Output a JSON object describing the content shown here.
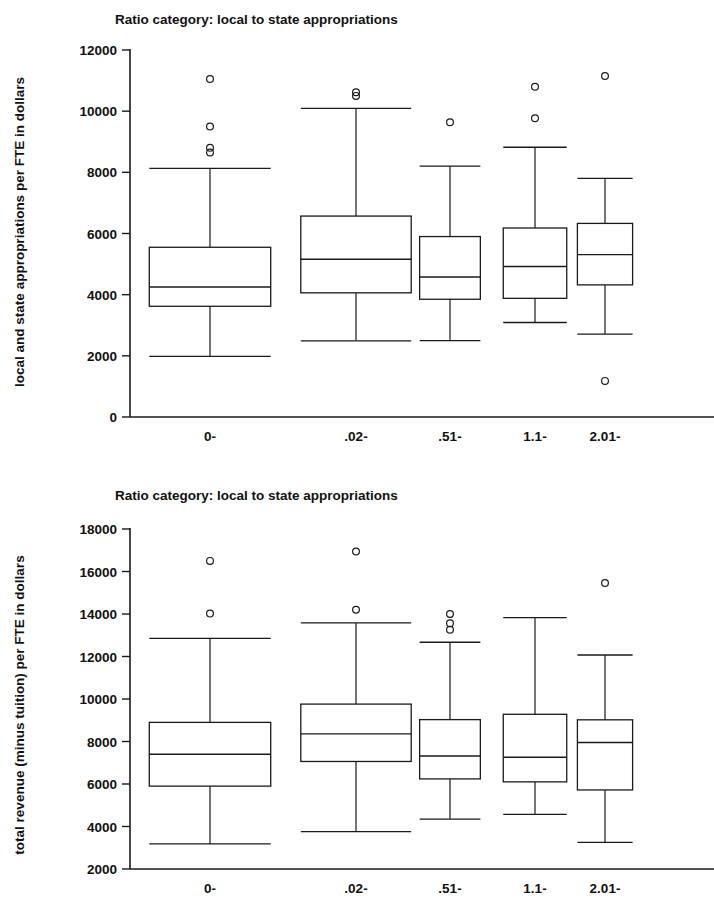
{
  "figure": {
    "background_color": "#ffffff",
    "ink_color": "#1a1a1a"
  },
  "chart_data": [
    {
      "id": "top",
      "type": "box",
      "title": "Ratio category: local to state appropriations",
      "xlabel": "",
      "ylabel": "local and state appropriations per FTE in dollars",
      "ylim": [
        0,
        12000
      ],
      "ytick_step": 2000,
      "ytick_labels": [
        "0",
        "2000",
        "4000",
        "6000",
        "8000",
        "10000",
        "12000"
      ],
      "grid": false,
      "legend": "none",
      "categories": [
        "0-",
        ".02-",
        ".51-",
        "1.1-",
        "2.01-"
      ],
      "boxes": [
        {
          "category": "0-",
          "whisker_low": 1980,
          "q1": 3620,
          "median": 4250,
          "q3": 5550,
          "whisker_high": 8130,
          "outliers": [
            11050,
            9500,
            8800,
            8650
          ],
          "width_frac": 0.88
        },
        {
          "category": ".02-",
          "whisker_low": 2490,
          "q1": 4060,
          "median": 5160,
          "q3": 6570,
          "whisker_high": 10090,
          "outliers": [
            10620,
            10500
          ],
          "width_frac": 0.8
        },
        {
          "category": ".51-",
          "whisker_low": 2500,
          "q1": 3850,
          "median": 4580,
          "q3": 5900,
          "whisker_high": 8200,
          "outliers": [
            9640
          ],
          "width_frac": 0.44
        },
        {
          "category": "1.1-",
          "whisker_low": 3090,
          "q1": 3880,
          "median": 4920,
          "q3": 6180,
          "whisker_high": 8820,
          "outliers": [
            10800,
            9770
          ],
          "width_frac": 0.46
        },
        {
          "category": "2.01-",
          "whisker_low": 2710,
          "q1": 4320,
          "median": 5310,
          "q3": 6330,
          "whisker_high": 7800,
          "outliers": [
            11150,
            1180
          ],
          "width_frac": 0.4
        }
      ]
    },
    {
      "id": "bottom",
      "type": "box",
      "title": "Ratio category: local to state appropriations",
      "xlabel": "",
      "ylabel": "total revenue (minus tuition) per FTE in dollars",
      "ylim": [
        2000,
        18000
      ],
      "ytick_step": 2000,
      "ytick_labels": [
        "2000",
        "4000",
        "6000",
        "8000",
        "10000",
        "12000",
        "14000",
        "16000",
        "18000"
      ],
      "grid": false,
      "legend": "none",
      "categories": [
        "0-",
        ".02-",
        ".51-",
        "1.1-",
        "2.01-"
      ],
      "boxes": [
        {
          "category": "0-",
          "whisker_low": 3180,
          "q1": 5900,
          "median": 7400,
          "q3": 8900,
          "whisker_high": 12850,
          "outliers": [
            16500,
            14020
          ],
          "width_frac": 0.88
        },
        {
          "category": ".02-",
          "whisker_low": 3760,
          "q1": 7060,
          "median": 8360,
          "q3": 9760,
          "whisker_high": 13580,
          "outliers": [
            16940,
            14200
          ],
          "width_frac": 0.8
        },
        {
          "category": ".51-",
          "whisker_low": 4350,
          "q1": 6240,
          "median": 7320,
          "q3": 9030,
          "whisker_high": 12670,
          "outliers": [
            14000,
            13560,
            13260
          ],
          "width_frac": 0.44
        },
        {
          "category": "1.1-",
          "whisker_low": 4570,
          "q1": 6100,
          "median": 7260,
          "q3": 9280,
          "whisker_high": 13830,
          "outliers": [],
          "width_frac": 0.46
        },
        {
          "category": "2.01-",
          "whisker_low": 3250,
          "q1": 5720,
          "median": 7950,
          "q3": 9020,
          "whisker_high": 12070,
          "outliers": [
            15460
          ],
          "width_frac": 0.4
        }
      ]
    }
  ]
}
